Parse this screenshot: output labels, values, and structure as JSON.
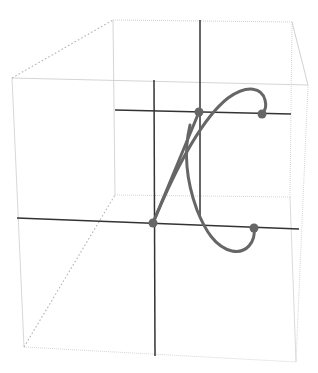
{
  "diagram": {
    "type": "3d-parametric-curve-in-box",
    "width": 318,
    "height": 373,
    "colors": {
      "background": "#ffffff",
      "box_edge": "#c8c8c8",
      "box_edge_dotted": "#b4b4b4",
      "axis": "#333333",
      "curve": "#666666",
      "point": "#666666"
    },
    "box": {
      "back_face": {
        "top_left": [
          113,
          20
        ],
        "top_right": [
          292,
          22
        ],
        "bottom_right": [
          290,
          197
        ],
        "bottom_left": [
          115,
          195
        ]
      },
      "front_face": {
        "top_left": [
          12,
          78
        ],
        "top_right": [
          308,
          85
        ],
        "bottom_right": [
          296,
          362
        ],
        "bottom_left": [
          24,
          347
        ]
      }
    },
    "axes": [
      {
        "name": "front-vertical-axis",
        "from": [
          154,
          80
        ],
        "to": [
          155,
          356
        ]
      },
      {
        "name": "back-vertical-axis",
        "from": [
          200,
          20
        ],
        "to": [
          200,
          218
        ]
      },
      {
        "name": "upper-horizontal-axis",
        "from": [
          115,
          110
        ],
        "to": [
          291,
          114
        ]
      },
      {
        "name": "lower-horizontal-axis",
        "from": [
          17,
          218
        ],
        "to": [
          299,
          229
        ]
      }
    ],
    "points": [
      {
        "name": "upper-left-point",
        "x": 199,
        "y": 112,
        "r": 4.5
      },
      {
        "name": "upper-right-point",
        "x": 262,
        "y": 114,
        "r": 4.5
      },
      {
        "name": "lower-left-point",
        "x": 153,
        "y": 223,
        "r": 4.5
      },
      {
        "name": "lower-right-point",
        "x": 254,
        "y": 228,
        "r": 4.5
      }
    ],
    "curves": [
      {
        "name": "curve-segment-straight",
        "d": "M153,223 L199,112"
      },
      {
        "name": "curve-segment-upper-arc",
        "d": "M153,223 C175,170 200,120 228,98 C248,84 262,88 265,100 C267,107 264,112 262,114"
      },
      {
        "name": "curve-segment-lower-arc",
        "d": "M190,125 C184,150 186,180 197,210 C205,230 215,247 232,251 C246,254 256,242 254,228"
      }
    ]
  }
}
